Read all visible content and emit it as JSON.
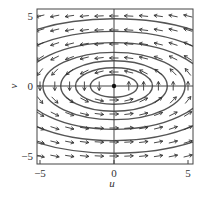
{
  "chart_data": {
    "type": "vector_field",
    "title": "",
    "xlabel": "u",
    "ylabel": "v",
    "xlim": [
      -5.2,
      5.3
    ],
    "ylim": [
      -5.5,
      5.5
    ],
    "xticks": [
      -5,
      0,
      5
    ],
    "yticks": [
      -5,
      0,
      5
    ],
    "xtick_labels": [
      "−5",
      "0",
      "5"
    ],
    "ytick_labels": [
      "−5",
      "0",
      "5"
    ],
    "grid": false,
    "axes_lines_through_origin": true,
    "equilibrium_point": [
      0,
      0
    ],
    "field": {
      "du_dt": "-v",
      "dv_dt": "u/4",
      "rotation": "counterclockwise"
    },
    "trajectories": [
      {
        "type": "ellipse",
        "center": [
          0,
          0
        ],
        "u_semi_axis": 1.6,
        "v_semi_axis": 0.8
      },
      {
        "type": "ellipse",
        "center": [
          0,
          0
        ],
        "u_semi_axis": 2.6,
        "v_semi_axis": 1.3
      },
      {
        "type": "ellipse",
        "center": [
          0,
          0
        ],
        "u_semi_axis": 3.6,
        "v_semi_axis": 1.8
      },
      {
        "type": "ellipse",
        "center": [
          0,
          0
        ],
        "u_semi_axis": 4.8,
        "v_semi_axis": 2.4
      },
      {
        "type": "ellipse",
        "center": [
          0,
          0
        ],
        "u_semi_axis": 6.2,
        "v_semi_axis": 3.1
      },
      {
        "type": "ellipse",
        "center": [
          0,
          0
        ],
        "u_semi_axis": 7.8,
        "v_semi_axis": 3.9
      },
      {
        "type": "ellipse",
        "center": [
          0,
          0
        ],
        "u_semi_axis": 9.6,
        "v_semi_axis": 4.8
      }
    ],
    "arrow_grid": {
      "u_values": [
        -5,
        -4,
        -3,
        -2,
        -1,
        0,
        1,
        2,
        3,
        4,
        5
      ],
      "v_values": [
        -5,
        -4,
        -3,
        -2,
        -1,
        0,
        1,
        2,
        3,
        4,
        5
      ]
    },
    "colors": {
      "curves": "#555555",
      "arrows": "#333333",
      "frame": "#444444"
    }
  }
}
